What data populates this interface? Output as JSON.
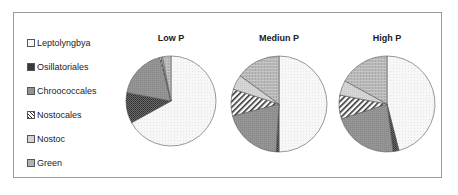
{
  "chart_data": {
    "type": "pie",
    "legend": {
      "position": "left",
      "entries": [
        "Leptolyngbya",
        "Osillatoriales",
        "Chroococcales",
        "Nostocales",
        "Nostoc",
        "Green"
      ]
    },
    "categories": [
      "Leptolyngbya",
      "Osillatoriales",
      "Chroococcales",
      "Nostocales",
      "Nostoc",
      "Green"
    ],
    "series": [
      {
        "name": "Low P",
        "values": [
          67,
          11,
          18,
          0.5,
          0.5,
          3
        ]
      },
      {
        "name": "Mediun P",
        "values": [
          50,
          1,
          20,
          9,
          5,
          15
        ]
      },
      {
        "name": "High P",
        "values": [
          46,
          2,
          22,
          8,
          5,
          17
        ]
      }
    ],
    "title": "",
    "xlabel": "",
    "ylabel": "",
    "grid": false
  },
  "legend": {
    "items": [
      {
        "label": "Leptolyngbya"
      },
      {
        "label": "Osillatoriales"
      },
      {
        "label": "Chroococcales"
      },
      {
        "label": "Nostocales"
      },
      {
        "label": "Nostoc"
      },
      {
        "label": "Green"
      }
    ]
  },
  "pies": [
    {
      "title": "Low P"
    },
    {
      "title": "Mediun P"
    },
    {
      "title": "High P"
    }
  ]
}
